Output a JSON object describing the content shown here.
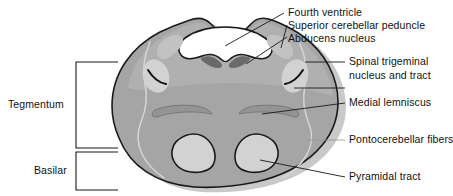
{
  "figure": {
    "type": "anatomical-cross-section",
    "colors": {
      "background": "#ffffff",
      "parenchyma": "#a5a5a5",
      "parenchyma_light": "#b4b4b4",
      "nucleus_light": "#d2d2d2",
      "nucleus_dark": "#6a6a6a",
      "ventricle": "#ffffff",
      "outline": "#1a1a1a",
      "leader": "#1a1a1a",
      "text": "#111111",
      "shadow": "#c9c9c9"
    }
  },
  "labels": {
    "fourth_ventricle": "Fourth ventricle",
    "superior_cerebellar_peduncle": "Superior cerebellar peduncle",
    "abducens_nucleus": "Abducens nucleus",
    "spinal_trigeminal_line1": "Spinal trigeminal",
    "spinal_trigeminal_line2": "nucleus and tract",
    "medial_lemniscus": "Medial lemniscus",
    "pontocerebellar_fibers": "Pontocerebellar fibers",
    "pyramidal_tract": "Pyramidal tract",
    "tegmentum": "Tegmentum",
    "basilar": "Basilar"
  },
  "structures": [
    {
      "name": "fourth-ventricle",
      "fill": "#ffffff"
    },
    {
      "name": "superior-cerebellar-peduncle",
      "fill": "#b8b8b8"
    },
    {
      "name": "abducens-nucleus",
      "fill": "#6a6a6a"
    },
    {
      "name": "spinal-trigeminal-nucleus-and-tract",
      "fill": "#d2d2d2"
    },
    {
      "name": "medial-lemniscus",
      "fill": "#9a9a9a"
    },
    {
      "name": "pontocerebellar-fibers",
      "fill": "#a5a5a5"
    },
    {
      "name": "pyramidal-tract",
      "fill": "#d2d2d2"
    }
  ],
  "regions": [
    {
      "name": "tegmentum",
      "label": "Tegmentum"
    },
    {
      "name": "basilar",
      "label": "Basilar"
    }
  ]
}
